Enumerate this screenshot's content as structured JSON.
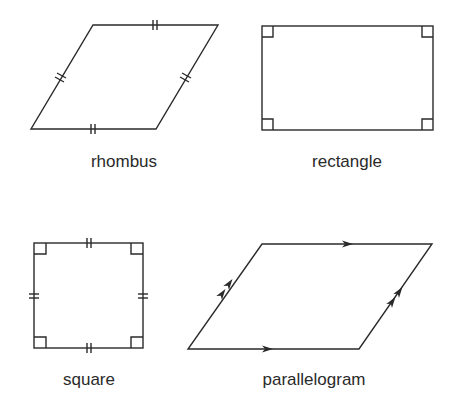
{
  "diagram": {
    "title": "",
    "stroke_color": "#2a2a2a",
    "shapes": [
      {
        "id": "rhombus",
        "label": "rhombus",
        "properties": [
          "four equal sides"
        ],
        "markings": "double tick marks on all four sides"
      },
      {
        "id": "rectangle",
        "label": "rectangle",
        "properties": [
          "four right angles"
        ],
        "markings": "right-angle squares at all four corners"
      },
      {
        "id": "square",
        "label": "square",
        "properties": [
          "four equal sides",
          "four right angles"
        ],
        "markings": "double tick marks on all sides and right-angle squares at all corners"
      },
      {
        "id": "parallelogram",
        "label": "parallelogram",
        "properties": [
          "opposite sides parallel"
        ],
        "markings": "single arrows on top and bottom sides, double arrows on left and right sides"
      }
    ]
  }
}
